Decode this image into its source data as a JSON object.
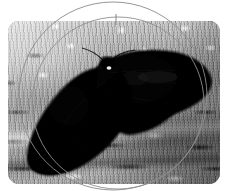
{
  "figure": {
    "kind": "photograph",
    "rendering": "black-and-white halftone photograph",
    "caption": "",
    "photo": {
      "x": 8,
      "y": 21,
      "width": 212,
      "height": 163,
      "corner_radius": 11,
      "background_color": "#8d8d8d"
    },
    "palette": {
      "page_background": "#ffffff",
      "bark_light": "#c9c9c5",
      "bark_mid": "#9a9a96",
      "bark_dark": "#3a3a37",
      "moth_body": "#0a0a0a",
      "moth_wing_shadow": "#050505",
      "moth_highlight": "#e8e8e4",
      "outline_stroke": "#8a8a8a"
    },
    "moth": {
      "morph": "carbonaria (melanic / dark form)",
      "posture": "wings spread flat against substrate",
      "body_highlight": "small white specular glint on thorax",
      "left_wing_label": "left forewing",
      "right_wing_label": "right forewing"
    },
    "substrate": {
      "label": "tree bark",
      "texture": "mottled lichen-flecked striated bark"
    },
    "overlay": {
      "label": "circular outline overlay",
      "shapes": [
        {
          "name": "outer-circle",
          "cx": 113,
          "cy": 96,
          "r": 94
        },
        {
          "name": "inner-circle",
          "cx": 118,
          "cy": 103,
          "r": 86
        }
      ],
      "tick": {
        "name": "vertical-tick-mark",
        "x": 116,
        "y_top": 14,
        "y_bottom": 25
      },
      "stroke_color": "#8a8a8a",
      "stroke_width": 0.9
    }
  }
}
